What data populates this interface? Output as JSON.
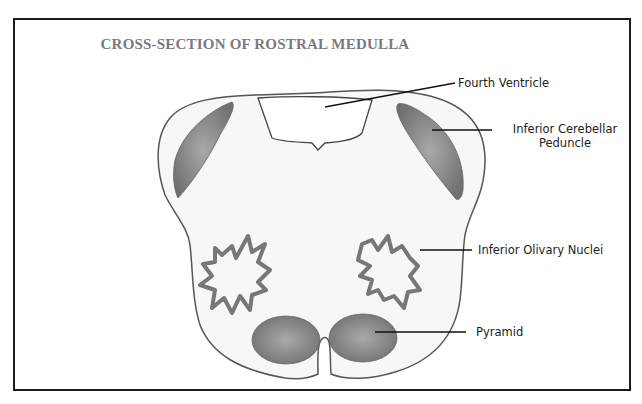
{
  "title": "CROSS-SECTION OF ROSTRAL MEDULLA",
  "labels": {
    "fourth_ventricle": "Fourth Ventricle",
    "inferior_cerebellar_peduncle_line1": "Inferior Cerebellar",
    "inferior_cerebellar_peduncle_line2": "Peduncle",
    "inferior_olivary_nuclei": "Inferior Olivary Nuclei",
    "pyramid": "Pyramid"
  },
  "colors": {
    "frame": "#1a1a1a",
    "title": "#7a7a7a",
    "outline": "#555555",
    "tissue_fill": "#f6f6f6",
    "shaded_fill": "#8e8e8e"
  }
}
